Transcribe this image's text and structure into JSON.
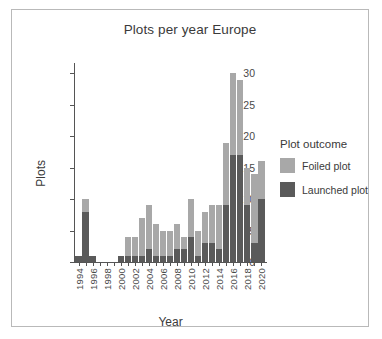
{
  "chart_data": {
    "type": "bar",
    "subtype": "stacked-bar",
    "title": "Plots per year Europe",
    "xlabel": "Year",
    "ylabel": "Plots",
    "ylim": [
      0,
      31
    ],
    "yticks": [
      0,
      5,
      10,
      15,
      20,
      25,
      30
    ],
    "grid": false,
    "legend": {
      "title": "Plot outcome",
      "position": "right",
      "entries": [
        {
          "name": "Foiled plot",
          "color": "#a8a8a8"
        },
        {
          "name": "Launched plot",
          "color": "#5a5a5a"
        }
      ]
    },
    "categories": [
      1994,
      1995,
      1996,
      1997,
      1998,
      1999,
      2000,
      2001,
      2002,
      2003,
      2004,
      2005,
      2006,
      2007,
      2008,
      2009,
      2010,
      2011,
      2012,
      2013,
      2014,
      2015,
      2016,
      2017,
      2018,
      2019,
      2020
    ],
    "xtick_labels": [
      "1994",
      "1996",
      "1998",
      "2000",
      "2002",
      "2004",
      "2006",
      "2008",
      "2010",
      "2012",
      "2014",
      "2016",
      "2018",
      "2020"
    ],
    "series": [
      {
        "name": "Launched plot",
        "color": "#5a5a5a",
        "values": [
          1,
          8,
          1,
          0,
          0,
          0,
          1,
          1,
          1,
          1,
          2,
          1,
          1,
          1,
          2,
          2,
          4,
          1,
          3,
          3,
          2,
          9,
          17,
          17,
          9,
          3,
          10
        ]
      },
      {
        "name": "Foiled plot",
        "color": "#a8a8a8",
        "values": [
          0,
          2,
          0,
          0,
          0,
          0,
          0,
          3,
          3,
          6,
          7,
          5,
          4,
          4,
          4,
          2,
          6,
          4,
          5,
          6,
          7,
          10,
          13,
          12,
          6,
          11,
          6
        ]
      }
    ],
    "totals": [
      1,
      10,
      1,
      0,
      0,
      0,
      1,
      4,
      4,
      7,
      9,
      6,
      5,
      5,
      6,
      4,
      10,
      5,
      8,
      9,
      9,
      19,
      30,
      29,
      15,
      14,
      16
    ]
  }
}
